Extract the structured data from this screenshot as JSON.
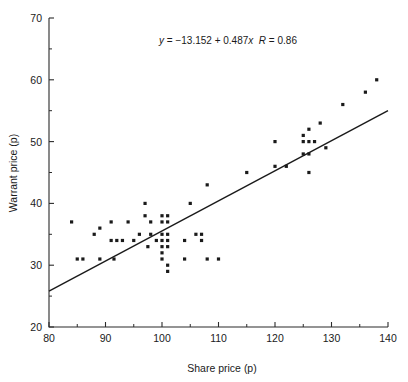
{
  "chart_data": {
    "type": "scatter",
    "title": "",
    "xlabel": "Share price (p)",
    "ylabel": "Warrant price (p)",
    "xlim": [
      80,
      140
    ],
    "ylim": [
      20,
      70
    ],
    "x_ticks": [
      80,
      90,
      100,
      110,
      120,
      130,
      140
    ],
    "y_ticks": [
      20,
      30,
      40,
      50,
      60,
      70
    ],
    "x_minor_ticks": [
      85,
      95,
      105,
      115,
      125,
      135
    ],
    "y_minor_ticks": [
      25,
      35,
      45,
      55,
      65
    ],
    "grid": false,
    "legend": null,
    "annotation": "y = −13.152 + 0.487x  R = 0.86",
    "annotation_parts": {
      "y": "y",
      "eq_body": " = −13.152 + 0.487",
      "x": "x",
      "gap": "  ",
      "R": "R",
      "r_value": " = 0.86"
    },
    "fit": {
      "type": "line",
      "intercept": -13.152,
      "slope": 0.487,
      "r": 0.86,
      "x_start": 80,
      "x_end": 140,
      "y_start": 25.8,
      "y_end": 55.1
    },
    "marker": "square",
    "marker_color": "#1a1a1a",
    "points": [
      [
        84,
        37
      ],
      [
        85,
        31
      ],
      [
        86,
        31
      ],
      [
        88,
        35
      ],
      [
        89,
        36
      ],
      [
        89,
        31
      ],
      [
        91,
        34
      ],
      [
        91,
        37
      ],
      [
        91.5,
        31
      ],
      [
        92,
        34
      ],
      [
        93,
        34
      ],
      [
        94,
        37
      ],
      [
        95,
        34
      ],
      [
        96,
        35
      ],
      [
        97,
        40
      ],
      [
        97,
        38
      ],
      [
        97.5,
        33
      ],
      [
        98,
        37
      ],
      [
        98,
        35
      ],
      [
        99,
        34
      ],
      [
        100,
        38
      ],
      [
        100,
        37
      ],
      [
        100,
        35
      ],
      [
        100,
        34
      ],
      [
        100,
        33
      ],
      [
        100,
        32
      ],
      [
        100,
        31
      ],
      [
        101,
        38
      ],
      [
        101,
        37
      ],
      [
        101,
        35
      ],
      [
        101,
        34
      ],
      [
        101,
        33
      ],
      [
        101,
        30
      ],
      [
        101,
        29
      ],
      [
        104,
        34
      ],
      [
        104,
        31
      ],
      [
        105,
        40
      ],
      [
        106,
        35
      ],
      [
        107,
        35
      ],
      [
        107,
        34
      ],
      [
        108,
        43
      ],
      [
        108,
        31
      ],
      [
        110,
        31
      ],
      [
        115,
        45
      ],
      [
        120,
        50
      ],
      [
        120,
        46
      ],
      [
        122,
        46
      ],
      [
        125,
        51
      ],
      [
        125,
        50
      ],
      [
        125,
        48
      ],
      [
        126,
        52
      ],
      [
        126,
        50
      ],
      [
        126,
        48
      ],
      [
        126,
        45
      ],
      [
        127,
        50
      ],
      [
        128,
        53
      ],
      [
        129,
        49
      ],
      [
        132,
        56
      ],
      [
        136,
        58
      ],
      [
        138,
        60
      ]
    ]
  }
}
